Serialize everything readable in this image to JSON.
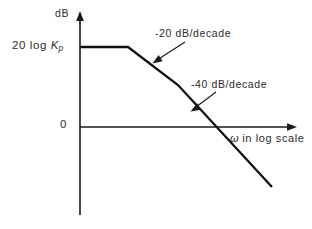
{
  "figure": {
    "kind": "bode-magnitude-asymptote-plot",
    "background_color": "#ffffff",
    "ink_color": "#1a1a1a"
  },
  "labels": {
    "y_axis_unit": "dB",
    "gain_prefix": "20 log ",
    "gain_symbol": "K",
    "gain_subscript": "p",
    "zero_tick": "0",
    "x_axis_symbol": "ω",
    "x_axis_rest": " in log scale",
    "slope_first": "-20 dB/decade",
    "slope_second": "-40 dB/decade"
  },
  "chart_data": {
    "type": "line",
    "title": "",
    "subtitle": "",
    "xlabel": "ω in log scale",
    "ylabel": "dB",
    "grid": false,
    "legend": null,
    "axes": {
      "x_axis_scale": "logarithmic",
      "y_axis_scale": "linear",
      "x_axis_y_value_db": 0,
      "x_tick_labels": [],
      "y_tick_labels": [
        "20 log K_p",
        "0"
      ],
      "x_axis_arrow": true,
      "y_axis_arrow": true
    },
    "series": [
      {
        "name": "asymptotic magnitude",
        "style": "piecewise-linear",
        "segments": [
          {
            "label": "0 dB/decade (low-frequency plateau)",
            "slope_db_per_decade": 0,
            "start": {
              "x_px": 80,
              "y_px": 47
            },
            "end": {
              "x_px": 128,
              "y_px": 47
            }
          },
          {
            "label": "-20 dB/decade",
            "slope_db_per_decade": -20,
            "start": {
              "x_px": 128,
              "y_px": 47
            },
            "end": {
              "x_px": 178,
              "y_px": 85
            }
          },
          {
            "label": "-40 dB/decade",
            "slope_db_per_decade": -40,
            "start": {
              "x_px": 178,
              "y_px": 85
            },
            "end": {
              "x_px": 272,
              "y_px": 187
            }
          }
        ],
        "break_points": [
          {
            "x_px": 128,
            "y_px": 47,
            "description": "first corner frequency, slope changes 0 to -20 dB/decade"
          },
          {
            "x_px": 178,
            "y_px": 85,
            "description": "second corner frequency, slope changes -20 to -40 dB/decade"
          }
        ],
        "zero_db_crossing": {
          "x_px": 224,
          "y_px": 127,
          "description": "gain crossover frequency"
        },
        "plateau_value_label": "20 log K_p"
      }
    ],
    "annotations": [
      {
        "text": "-20 dB/decade",
        "text_px": {
          "x": 155,
          "y": 28
        },
        "leader_from_px": {
          "x": 185,
          "y": 42
        },
        "leader_to_px": {
          "x": 154,
          "y": 62
        },
        "points_at": "-20 dB/decade segment"
      },
      {
        "text": "-40 dB/decade",
        "text_px": {
          "x": 191,
          "y": 79
        },
        "leader_from_px": {
          "x": 216,
          "y": 92
        },
        "leader_to_px": {
          "x": 192,
          "y": 110
        },
        "points_at": "-40 dB/decade segment"
      }
    ]
  }
}
